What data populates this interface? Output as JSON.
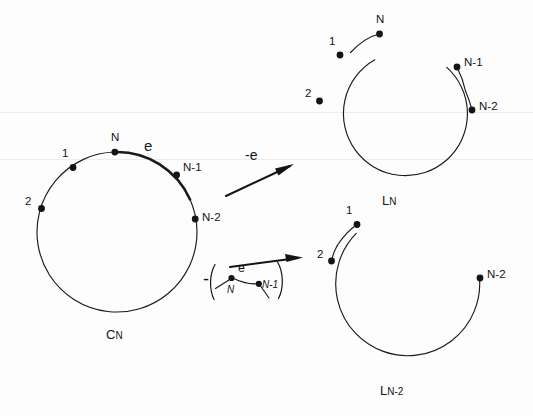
{
  "figure": {
    "background_color": "#fdfdfd",
    "ink_color": "#141414"
  },
  "graphs": [
    {
      "id": "cycle",
      "name_label": "C",
      "name_subscript": "N",
      "shape": "full-circle",
      "edge_label": "e",
      "bold_edge_between": [
        "N",
        "N-1"
      ],
      "nodes": [
        {
          "label": "N"
        },
        {
          "label": "1"
        },
        {
          "label": "2"
        },
        {
          "label": "N-1"
        },
        {
          "label": "N-2"
        }
      ]
    },
    {
      "id": "path-n",
      "name_label": "L",
      "name_subscript": "N",
      "shape": "open-arc",
      "nodes": [
        {
          "label": "N"
        },
        {
          "label": "1"
        },
        {
          "label": "2"
        },
        {
          "label": "N-1"
        },
        {
          "label": "N-2"
        }
      ]
    },
    {
      "id": "path-n-minus-2",
      "name_label": "L",
      "name_subscript": "N-2",
      "shape": "open-arc",
      "nodes": [
        {
          "label": "1"
        },
        {
          "label": "2"
        },
        {
          "label": "N-2"
        }
      ]
    }
  ],
  "arrows": [
    {
      "id": "delete-edge",
      "label": "-e",
      "direction": "up-right",
      "target_graph": "path-n"
    },
    {
      "id": "contract-edge",
      "label_prefix": "-",
      "label_open_paren": "(",
      "label_close_paren": ")",
      "direction": "up-right",
      "target_graph": "path-n-minus-2",
      "inset": {
        "edge_label": "e",
        "nodes": [
          {
            "label": "N"
          },
          {
            "label": "N-1"
          }
        ]
      }
    }
  ]
}
